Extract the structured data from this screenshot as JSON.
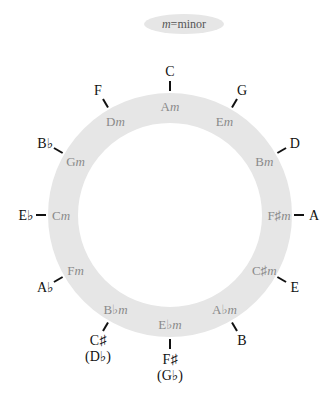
{
  "legend": {
    "text_italic": "m",
    "text_rest": "=minor"
  },
  "colors": {
    "ring": "#e6e6e6",
    "legend_bg": "#e6e6e6",
    "major_text": "#111111",
    "minor_text": "#8a8a8a",
    "tick": "#111111"
  },
  "geometry": {
    "cx": 170,
    "cy": 215,
    "outer_r": 122,
    "inner_r": 92
  },
  "keys": [
    {
      "major": "C",
      "minor_root": "A",
      "minor_suffix": "m"
    },
    {
      "major": "G",
      "minor_root": "E",
      "minor_suffix": "m"
    },
    {
      "major": "D",
      "minor_root": "B",
      "minor_suffix": "m"
    },
    {
      "major": "A",
      "minor_root": "F♯",
      "minor_suffix": "m"
    },
    {
      "major": "E",
      "minor_root": "C♯",
      "minor_suffix": "m"
    },
    {
      "major": "B",
      "minor_root": "A♭",
      "minor_suffix": "m"
    },
    {
      "major": "F♯",
      "major_alt": "(G♭)",
      "minor_root": "E♭",
      "minor_suffix": "m"
    },
    {
      "major": "C♯",
      "major_alt": "(D♭)",
      "minor_root": "B♭",
      "minor_suffix": "m"
    },
    {
      "major": "A♭",
      "minor_root": "F",
      "minor_suffix": "m"
    },
    {
      "major": "E♭",
      "minor_root": "C",
      "minor_suffix": "m"
    },
    {
      "major": "B♭",
      "minor_root": "G",
      "minor_suffix": "m"
    },
    {
      "major": "F",
      "minor_root": "D",
      "minor_suffix": "m"
    }
  ]
}
